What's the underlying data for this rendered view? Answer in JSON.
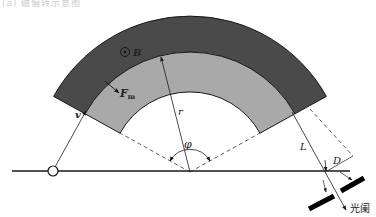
{
  "caption": "(a) 磁偏转示意图",
  "colors": {
    "outer_band": "#4a4a4a",
    "inner_band": "#a9a9a9",
    "line": "#1a1a1a",
    "background": "#ffffff"
  },
  "geometry": {
    "center": [
      190,
      172
    ],
    "radius_outer": 156,
    "radius_mid": 120,
    "radius_inner": 80,
    "angle_start_deg": 29,
    "angle_end_deg": 151
  },
  "labels": {
    "B": "B",
    "Fm_main": "F",
    "Fm_sub": "m",
    "v": "v",
    "r": "r",
    "phi": "φ",
    "L": "L",
    "D": "D",
    "slit": "光阑"
  },
  "symbols": {
    "magnetic_field": "dot-in-circle (field out of page)",
    "source": "hollow-circle"
  }
}
